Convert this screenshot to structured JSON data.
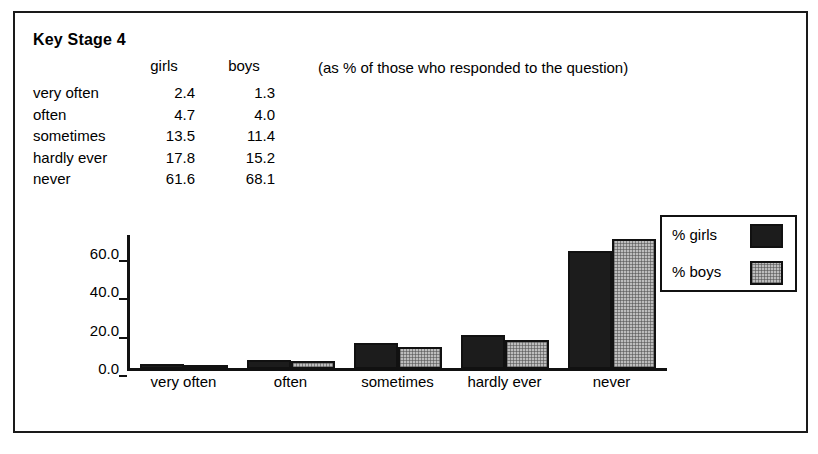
{
  "figure": {
    "title": "Key Stage 4",
    "note": "(as % of those who responded to the question)"
  },
  "table": {
    "header": {
      "label": "",
      "girls": "girls",
      "boys": "boys"
    },
    "rows": [
      {
        "label": "very often",
        "girls": "2.4",
        "boys": "1.3"
      },
      {
        "label": "often",
        "girls": "4.7",
        "boys": "4.0"
      },
      {
        "label": "sometimes",
        "girls": "13.5",
        "boys": "11.4"
      },
      {
        "label": "hardly ever",
        "girls": "17.8",
        "boys": "15.2"
      },
      {
        "label": "never",
        "girls": "61.6",
        "boys": "68.1"
      }
    ]
  },
  "legend": {
    "items": [
      {
        "label": "% girls",
        "color": "#1c1c1c"
      },
      {
        "label": "% boys",
        "color": "#bdbdbd"
      }
    ]
  },
  "axis": {
    "yticks": [
      "0.0",
      "20.0",
      "40.0",
      "60.0"
    ]
  },
  "chart_data": {
    "type": "bar",
    "title": "Key Stage 4",
    "subtitle": "(as % of those who responded to the question)",
    "categories": [
      "very often",
      "often",
      "sometimes",
      "hardly ever",
      "never"
    ],
    "series": [
      {
        "name": "% girls",
        "values": [
          2.4,
          4.7,
          13.5,
          17.8,
          61.6
        ],
        "color": "#1c1c1c"
      },
      {
        "name": "% boys",
        "values": [
          1.3,
          4.0,
          11.4,
          15.2,
          68.1
        ],
        "color": "#bdbdbd"
      }
    ],
    "xlabel": "",
    "ylabel": "",
    "ylim": [
      0,
      70
    ],
    "yticks": [
      0.0,
      20.0,
      40.0,
      60.0
    ],
    "ytick_labels": [
      "0.0",
      "20.0",
      "40.0",
      "60.0"
    ],
    "grid": false,
    "legend_position": "right"
  }
}
